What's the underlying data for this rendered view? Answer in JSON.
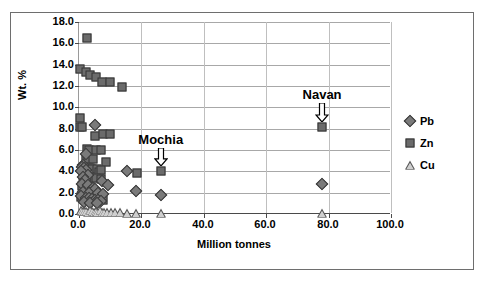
{
  "chart_data": {
    "type": "scatter",
    "title": "SEDEX",
    "xlabel": "Million tonnes",
    "ylabel": "Wt. %",
    "xlim": [
      0.0,
      100.0
    ],
    "ylim": [
      0.0,
      18.0
    ],
    "xticks": [
      "0.0",
      "20.0",
      "40.0",
      "60.0",
      "80.0",
      "100.0"
    ],
    "xtick_values": [
      0,
      20,
      40,
      60,
      80,
      100
    ],
    "yticks": [
      "0.0",
      "2.0",
      "4.0",
      "6.0",
      "8.0",
      "10.0",
      "12.0",
      "14.0",
      "16.0",
      "18.0"
    ],
    "ytick_values": [
      0,
      2,
      4,
      6,
      8,
      10,
      12,
      14,
      16,
      18
    ],
    "grid": "horizontal-and-vertical",
    "legend_position": "right",
    "legend": [
      {
        "name": "Pb",
        "marker": "diamond",
        "color": "#7a7a7a"
      },
      {
        "name": "Zn",
        "marker": "square",
        "color": "#6b6b6b"
      },
      {
        "name": "Cu",
        "marker": "triangle",
        "color": "#cfcfcf"
      }
    ],
    "series": [
      {
        "name": "Zn",
        "marker": "square",
        "color": "#6b6b6b",
        "points": [
          [
            2.6,
            16.5
          ],
          [
            0.3,
            13.6
          ],
          [
            2.4,
            13.3
          ],
          [
            3.6,
            13.0
          ],
          [
            5.3,
            12.8
          ],
          [
            7.4,
            12.4
          ],
          [
            9.8,
            12.4
          ],
          [
            13.8,
            11.9
          ],
          [
            0.3,
            9.0
          ],
          [
            0.3,
            8.2
          ],
          [
            1.1,
            8.2
          ],
          [
            5.2,
            7.3
          ],
          [
            7.8,
            7.5
          ],
          [
            10.0,
            7.5
          ],
          [
            2.6,
            6.1
          ],
          [
            3.3,
            6.0
          ],
          [
            5.6,
            6.0
          ],
          [
            6.9,
            6.0
          ],
          [
            2.2,
            5.2
          ],
          [
            3.0,
            5.0
          ],
          [
            4.4,
            5.2
          ],
          [
            8.6,
            4.9
          ],
          [
            1.6,
            4.4
          ],
          [
            2.4,
            4.4
          ],
          [
            3.4,
            4.3
          ],
          [
            4.3,
            4.2
          ],
          [
            5.8,
            4.2
          ],
          [
            6.4,
            3.9
          ],
          [
            7.1,
            4.1
          ],
          [
            18.6,
            3.8
          ],
          [
            26.2,
            4.0
          ],
          [
            1.8,
            3.5
          ],
          [
            3.0,
            3.3
          ],
          [
            4.0,
            3.4
          ],
          [
            5.6,
            3.4
          ],
          [
            6.9,
            3.3
          ],
          [
            1.1,
            2.6
          ],
          [
            2.0,
            2.3
          ],
          [
            0.8,
            1.6
          ],
          [
            1.6,
            1.5
          ],
          [
            4.4,
            1.5
          ],
          [
            5.5,
            1.4
          ],
          [
            6.7,
            1.5
          ],
          [
            7.6,
            1.3
          ],
          [
            77.9,
            8.2
          ]
        ]
      },
      {
        "name": "Pb",
        "marker": "diamond",
        "color": "#7a7a7a",
        "points": [
          [
            5.0,
            8.3
          ],
          [
            2.2,
            5.6
          ],
          [
            1.3,
            4.6
          ],
          [
            0.9,
            4.4
          ],
          [
            1.6,
            4.3
          ],
          [
            2.3,
            4.1
          ],
          [
            0.7,
            4.0
          ],
          [
            15.3,
            4.0
          ],
          [
            2.9,
            3.7
          ],
          [
            1.2,
            3.5
          ],
          [
            2.0,
            3.2
          ],
          [
            7.3,
            3.1
          ],
          [
            1.0,
            2.8
          ],
          [
            2.8,
            2.7
          ],
          [
            9.3,
            2.7
          ],
          [
            4.4,
            2.4
          ],
          [
            5.2,
            2.3
          ],
          [
            18.3,
            2.2
          ],
          [
            77.8,
            2.8
          ],
          [
            1.4,
            2.1
          ],
          [
            3.2,
            2.0
          ],
          [
            6.0,
            2.0
          ],
          [
            7.6,
            1.9
          ],
          [
            26.3,
            1.8
          ],
          [
            0.8,
            1.7
          ],
          [
            2.1,
            1.5
          ],
          [
            3.1,
            1.5
          ],
          [
            4.1,
            1.4
          ],
          [
            5.0,
            1.3
          ],
          [
            6.1,
            1.3
          ],
          [
            7.0,
            1.2
          ],
          [
            1.7,
            1.1
          ],
          [
            3.6,
            1.0
          ],
          [
            5.7,
            1.0
          ]
        ]
      },
      {
        "name": "Cu",
        "marker": "triangle",
        "color": "#cfcfcf",
        "points": [
          [
            0.5,
            0.35
          ],
          [
            1.1,
            0.3
          ],
          [
            1.7,
            0.25
          ],
          [
            2.3,
            0.3
          ],
          [
            2.9,
            0.2
          ],
          [
            3.5,
            0.4
          ],
          [
            4.1,
            0.25
          ],
          [
            4.7,
            0.2
          ],
          [
            5.3,
            0.3
          ],
          [
            5.9,
            0.2
          ],
          [
            6.6,
            0.35
          ],
          [
            7.3,
            0.2
          ],
          [
            8.1,
            0.2
          ],
          [
            9.0,
            0.2
          ],
          [
            10.2,
            0.15
          ],
          [
            11.5,
            0.15
          ],
          [
            13.2,
            0.15
          ],
          [
            15.5,
            0.1
          ],
          [
            18.4,
            0.1
          ],
          [
            26.2,
            0.1
          ],
          [
            77.9,
            0.1
          ]
        ]
      }
    ],
    "annotations": [
      {
        "label": "Mochia",
        "x": 26.2,
        "y": 4.0,
        "text_y": 6.9,
        "arrow": "down"
      },
      {
        "label": "Navan",
        "x": 77.9,
        "y": 8.2,
        "text_y": 11.2,
        "arrow": "down"
      }
    ]
  }
}
